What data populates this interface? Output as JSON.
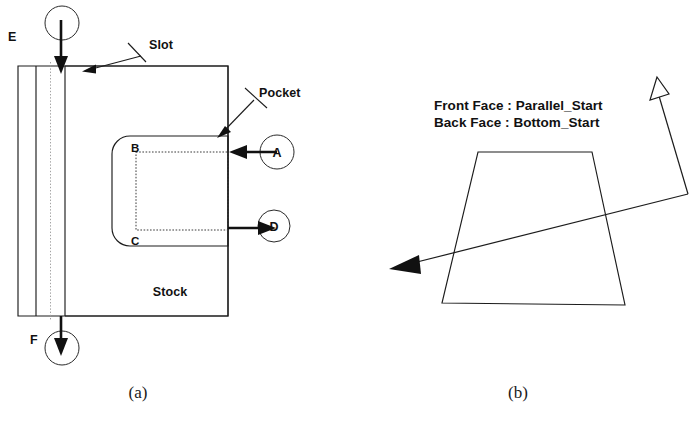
{
  "figure": {
    "width": 697,
    "height": 435,
    "background": "#ffffff",
    "ink_color": "#111111",
    "panels": [
      {
        "id": "a",
        "caption": "(a)",
        "caption_x": 138,
        "caption_y": 398
      },
      {
        "id": "b",
        "caption": "(b)",
        "caption_x": 518,
        "caption_y": 398
      }
    ]
  },
  "panel_a": {
    "description": "Orthographic view of a rectangular stock block containing a machined slot and a pocket, annotated with lettered feature balloons A through F.",
    "stock_label": "Stock",
    "stock_label_x": 170,
    "stock_label_y": 295,
    "feature_callouts": [
      {
        "name": "slot",
        "label": "Slot",
        "label_x": 149,
        "label_y": 49
      },
      {
        "name": "pocket",
        "label": "Pocket",
        "label_x": 259,
        "label_y": 97
      }
    ],
    "pocket_corner_labels": [
      {
        "name": "pocket-corner-b",
        "label": "B",
        "x": 134,
        "y": 152
      },
      {
        "name": "pocket-corner-c",
        "label": "C",
        "x": 134,
        "y": 243
      }
    ],
    "balloons": [
      {
        "name": "balloon-a",
        "label": "A",
        "cx": 277,
        "cy": 152,
        "r": 17,
        "label_x": 277,
        "label_y": 157
      },
      {
        "name": "balloon-d",
        "label": "D",
        "cx": 274,
        "cy": 226,
        "r": 16,
        "label_x": 274,
        "label_y": 231
      },
      {
        "name": "balloon-e",
        "label": "E",
        "cx": 62,
        "cy": 23,
        "r": 17,
        "label_x": 14,
        "label_y": 41
      },
      {
        "name": "balloon-f",
        "label": "F",
        "cx": 62,
        "cy": 348,
        "r": 17,
        "label_x": 36,
        "label_y": 344
      }
    ]
  },
  "panel_b": {
    "description": "Trapezoidal face with a hollow up arrow and a solid diagonal arrow indicating toolpath start directions.",
    "front_face_line": "Front Face : Parallel_Start",
    "back_face_line": "Back Face : Bottom_Start",
    "front_face_x": 434,
    "front_face_y": 110,
    "back_face_x": 434,
    "back_face_y": 127
  }
}
